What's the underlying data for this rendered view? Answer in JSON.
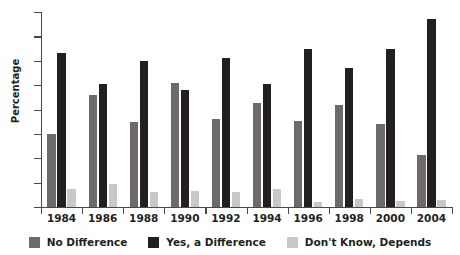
{
  "chart_data": {
    "type": "bar",
    "title": "",
    "xlabel": "",
    "ylabel": "Percentage",
    "ylim": [
      0,
      80
    ],
    "yticks": [
      0,
      10,
      20,
      30,
      40,
      50,
      60,
      70,
      80
    ],
    "grid": false,
    "legend_position": "bottom",
    "categories": [
      "1984",
      "1986",
      "1988",
      "1990",
      "1992",
      "1994",
      "1996",
      "1998",
      "2000",
      "2004"
    ],
    "series": [
      {
        "name": "No Difference",
        "color": "#6d6a6b",
        "values": [
          30,
          46,
          35,
          51,
          36,
          42.5,
          35.5,
          42,
          34,
          21.5
        ]
      },
      {
        "name": "Yes, a Difference",
        "color": "#231f1f",
        "values": [
          63,
          50.5,
          60,
          48,
          61,
          50.5,
          65,
          57,
          65,
          77
        ]
      },
      {
        "name": "Don't Know, Depends",
        "color": "#c9c8c6",
        "values": [
          7.5,
          9.5,
          6,
          6.5,
          6,
          7.5,
          2,
          3.5,
          2.5,
          3
        ]
      }
    ]
  },
  "axis": {
    "label_color": "#231f20",
    "line_color": "#4c4747"
  }
}
